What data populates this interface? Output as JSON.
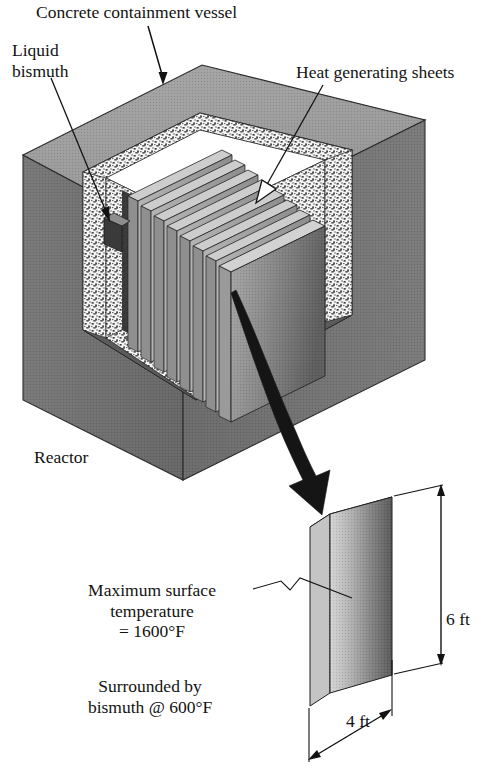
{
  "figure": {
    "background_color": "#ffffff",
    "ink_color": "#121212"
  },
  "labels": {
    "concrete_vessel": "Concrete containment vessel",
    "liquid_bismuth_line1": "Liquid",
    "liquid_bismuth_line2": "bismuth",
    "heat_sheets": "Heat generating sheets",
    "reactor": "Reactor",
    "max_surface_line1": "Maximum surface",
    "max_surface_line2": "temperature",
    "max_surface_line3": "= 1600°F",
    "surrounded_line1": "Surrounded by",
    "surrounded_line2": "bismuth @ 600°F"
  },
  "dimensions": {
    "height": "6 ft",
    "width": "4 ft"
  },
  "values": {
    "max_surface_temperature_F": 1600,
    "bismuth_temperature_F": 600,
    "plate_height_ft": 6,
    "plate_width_ft": 4,
    "sheet_count": 8
  },
  "colors": {
    "block_top": "#9b9b9b",
    "block_left": "#6f6f6f",
    "block_right": "#707070",
    "concrete_speckle_base": "#f2f2f2",
    "cavity_back": "#6a6a6a",
    "cavity_side": "#4a4a4a",
    "sheet_face_light": "#b9b9b9",
    "sheet_face_dark": "#6d6d6d",
    "sheet_edge": "#c9c9c9",
    "sheet_gap": "#3c3c3c",
    "plate_face_light": "#cfcfcf",
    "plate_face_dark": "#5a5a5a",
    "plate_top": "#d8d8d8",
    "plate_side": "#c2c2c2",
    "arrow_fill": "#151515"
  }
}
